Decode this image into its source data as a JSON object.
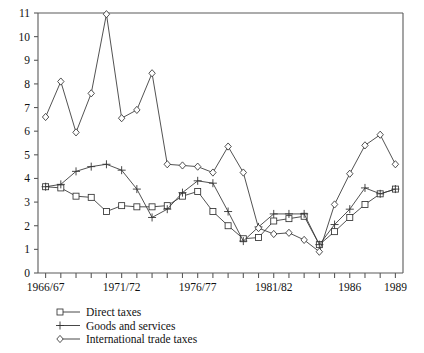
{
  "chart_data": {
    "type": "line",
    "title": "",
    "xlabel": "",
    "ylabel": "",
    "ylim": [
      0,
      11
    ],
    "yticks": [
      0,
      1,
      2,
      3,
      4,
      5,
      6,
      7,
      8,
      9,
      10,
      11
    ],
    "grid": false,
    "legend_position": "below",
    "x": [
      "1966/67",
      "1967/68",
      "1968/69",
      "1969/70",
      "1970/71",
      "1971/72",
      "1972/73",
      "1973/74",
      "1974/75",
      "1975/76",
      "1976/77",
      "1977/78",
      "1978/79",
      "1979/80",
      "1980/81",
      "1981/82",
      "1982/83",
      "1983/84",
      "1984/85",
      "1985",
      "1986",
      "1987",
      "1988",
      "1989"
    ],
    "xtick_labels": [
      "1966/67",
      "",
      "",
      "",
      "",
      "1971/72",
      "",
      "",
      "",
      "",
      "1976/77",
      "",
      "",
      "",
      "",
      "1981/82",
      "",
      "",
      "",
      "",
      "1986",
      "",
      "",
      "1989"
    ],
    "xtick_labels_shown": [
      "1966/67",
      "1971/72",
      "1976/77",
      "1981/82",
      "1986",
      "1989"
    ],
    "series": [
      {
        "name": "Direct taxes",
        "marker": "square",
        "values": [
          3.65,
          3.6,
          3.25,
          3.2,
          2.6,
          2.85,
          2.8,
          2.8,
          2.85,
          3.25,
          3.45,
          2.6,
          2.0,
          1.45,
          1.5,
          2.2,
          2.3,
          2.4,
          1.2,
          1.75,
          2.35,
          2.9,
          3.35,
          3.55
        ]
      },
      {
        "name": "Goods and services",
        "marker": "cross",
        "values": [
          3.65,
          3.75,
          4.3,
          4.5,
          4.6,
          4.35,
          3.55,
          2.35,
          2.7,
          3.4,
          3.9,
          3.8,
          2.6,
          1.35,
          1.95,
          2.5,
          2.5,
          2.5,
          1.2,
          2.05,
          2.7,
          3.6,
          3.35,
          3.55
        ]
      },
      {
        "name": "International trade taxes",
        "marker": "diamond",
        "values": [
          6.6,
          8.1,
          5.95,
          7.6,
          10.95,
          6.55,
          6.9,
          8.45,
          4.6,
          4.55,
          4.5,
          4.25,
          5.35,
          4.25,
          1.9,
          1.65,
          1.7,
          1.4,
          0.9,
          2.9,
          4.2,
          5.4,
          5.85,
          4.6
        ]
      }
    ]
  },
  "legend": {
    "items": [
      {
        "label": "Direct taxes",
        "marker": "square"
      },
      {
        "label": "Goods and services",
        "marker": "cross"
      },
      {
        "label": "International trade taxes",
        "marker": "diamond"
      }
    ]
  }
}
